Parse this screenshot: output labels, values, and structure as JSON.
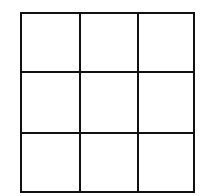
{
  "diagram": {
    "type": "grid",
    "rows": 3,
    "columns": 3,
    "line_color": "#111111",
    "background": "#ffffff",
    "cells": [
      [
        "",
        "",
        ""
      ],
      [
        "",
        "",
        ""
      ],
      [
        "",
        "",
        ""
      ]
    ]
  }
}
